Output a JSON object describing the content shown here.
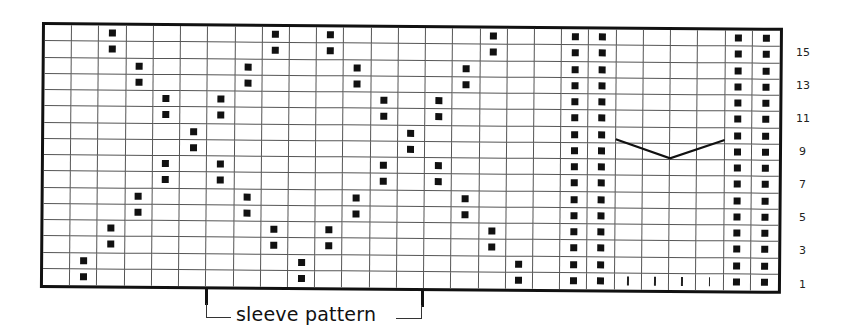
{
  "chart": {
    "title": "",
    "type": "knitting-chart",
    "columns": 27,
    "rows": 16,
    "row_numbering": "bottom-up",
    "colors": {
      "grid_line": "#555555",
      "border": "#111111",
      "stitch_symbol": "#111111",
      "background": "#ffffff"
    },
    "symbols": {
      "dot": "filled-square",
      "tick": "vertical-bar"
    },
    "dots_by_row": {
      "16": [
        2,
        8,
        10,
        16,
        19,
        20,
        25,
        26
      ],
      "15": [
        2,
        8,
        10,
        16,
        19,
        20,
        25,
        26
      ],
      "14": [
        3,
        7,
        11,
        15,
        19,
        20,
        25,
        26
      ],
      "13": [
        3,
        7,
        11,
        15,
        19,
        20,
        25,
        26
      ],
      "12": [
        4,
        6,
        12,
        14,
        19,
        20,
        25,
        26
      ],
      "11": [
        4,
        6,
        12,
        14,
        19,
        20,
        25,
        26
      ],
      "10": [
        5,
        13,
        19,
        20,
        25,
        26
      ],
      "9": [
        5,
        13,
        19,
        20,
        25,
        26
      ],
      "8": [
        4,
        6,
        12,
        14,
        19,
        20,
        25,
        26
      ],
      "7": [
        4,
        6,
        12,
        14,
        19,
        20,
        25,
        26
      ],
      "6": [
        3,
        7,
        11,
        15,
        19,
        20,
        25,
        26
      ],
      "5": [
        3,
        7,
        11,
        15,
        19,
        20,
        25,
        26
      ],
      "4": [
        2,
        8,
        10,
        16,
        19,
        20,
        25,
        26
      ],
      "3": [
        2,
        8,
        10,
        16,
        19,
        20,
        25,
        26
      ],
      "2": [
        1,
        9,
        17,
        19,
        20,
        25,
        26
      ],
      "1": [
        1,
        9,
        17,
        19,
        20,
        25,
        26
      ]
    },
    "ticks_by_row": {
      "1": [
        21,
        22,
        23,
        24
      ]
    },
    "v_line": {
      "description": "V-shaped line across columns 21-24 at rows 10/9",
      "start_col_edge": 21,
      "end_col_edge": 25,
      "start_row_from_top": 6.75,
      "vertex_row_from_top": 7.9,
      "end_row_from_top": 6.75
    },
    "row_labels": [
      "15",
      "13",
      "11",
      "9",
      "7",
      "5",
      "3",
      "1"
    ],
    "row_label_rows": [
      15,
      13,
      11,
      9,
      7,
      5,
      3,
      1
    ]
  },
  "annotation": {
    "label": "sleeve pattern",
    "start_col": 6,
    "end_col": 14
  }
}
